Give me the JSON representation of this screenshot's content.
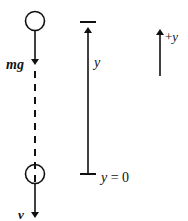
{
  "diagram": {
    "colors": {
      "stroke": "#111111",
      "background": "#ffffff"
    },
    "ball_top": {
      "force_label": "mg",
      "force_arrow": "down"
    },
    "ball_bottom": {
      "velocity_label": "v",
      "velocity_arrow": "down"
    },
    "connector": {
      "style": "dashed"
    },
    "height_axis": {
      "label": "y",
      "bottom_label": "y = 0",
      "bottom_label_parts": {
        "var": "y",
        "eq": " = 0"
      }
    },
    "positive_direction": {
      "label": "+y",
      "label_parts": {
        "sign": "+",
        "var": "y"
      },
      "arrow": "up"
    }
  }
}
